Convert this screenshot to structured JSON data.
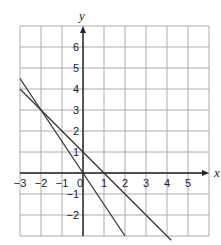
{
  "chart_data": {
    "type": "line",
    "title": "",
    "xlabel": "x",
    "ylabel": "y",
    "xlim": [
      -3,
      6
    ],
    "ylim": [
      -3,
      7
    ],
    "grid": true,
    "x_ticks": [
      "-3",
      "-2",
      "-1",
      "0",
      "1",
      "2",
      "3",
      "4",
      "5"
    ],
    "y_ticks": [
      "6",
      "5",
      "4",
      "3",
      "2",
      "1",
      "-1",
      "-2"
    ],
    "series": [
      {
        "name": "y = -x + 1",
        "points": [
          [
            -3,
            4
          ],
          [
            4.2,
            -3.2
          ]
        ]
      },
      {
        "name": "y = -1.5x",
        "points": [
          [
            -3,
            4.5
          ],
          [
            2,
            -3
          ]
        ]
      }
    ],
    "intersection": [
      -2,
      3
    ]
  },
  "labels": {
    "x": "x",
    "y": "y",
    "origin": "0"
  }
}
